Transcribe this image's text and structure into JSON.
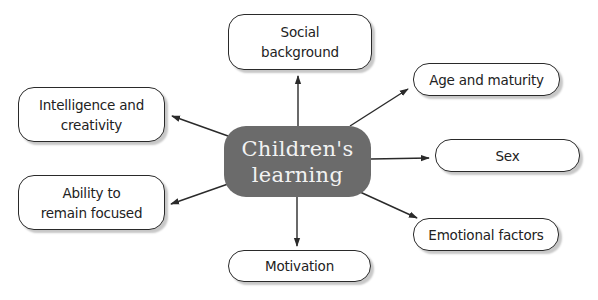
{
  "diagram": {
    "center": {
      "label": "Children's\nlearning"
    },
    "nodes": [
      {
        "id": "social-background",
        "label": "Social\nbackground"
      },
      {
        "id": "intelligence-and-creativity",
        "label": "Intelligence and\ncreativity"
      },
      {
        "id": "age-and-maturity",
        "label": "Age and maturity"
      },
      {
        "id": "sex",
        "label": "Sex"
      },
      {
        "id": "ability-to-remain-focused",
        "label": "Ability to\nremain focused"
      },
      {
        "id": "emotional-factors",
        "label": "Emotional factors"
      },
      {
        "id": "motivation",
        "label": "Motivation"
      }
    ],
    "edges": [
      {
        "from": "childrens-learning",
        "to": "social-background"
      },
      {
        "from": "childrens-learning",
        "to": "intelligence-and-creativity"
      },
      {
        "from": "childrens-learning",
        "to": "age-and-maturity"
      },
      {
        "from": "childrens-learning",
        "to": "sex"
      },
      {
        "from": "childrens-learning",
        "to": "ability-to-remain-focused"
      },
      {
        "from": "childrens-learning",
        "to": "emotional-factors"
      },
      {
        "from": "childrens-learning",
        "to": "motivation"
      }
    ],
    "colors": {
      "center_fill": "#6b6b6b",
      "center_text": "#f2f2f2",
      "node_border": "#2a2a2a",
      "arrow": "#2a2a2a"
    }
  }
}
